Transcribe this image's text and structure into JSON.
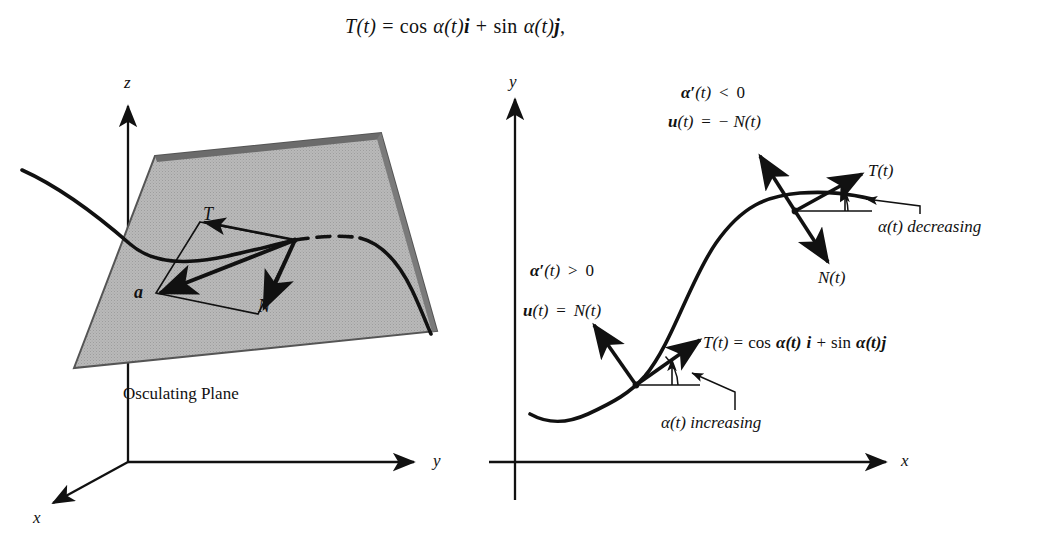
{
  "figure": {
    "type": "math-textbook-figure",
    "caption_equation": {
      "lhs": "T(t)",
      "eq": "=",
      "term1_fn": "cos",
      "term1_arg": "α(t)",
      "term1_vec": "i",
      "plus": "+",
      "term2_fn": "sin",
      "term2_arg": "α(t)",
      "term2_vec": "j",
      "comma": ","
    },
    "colors": {
      "ink": "#111111",
      "plane_fill": "#b4b4b4",
      "plane_edge": "#4a4a4a",
      "background": "#ffffff"
    }
  },
  "left_panel": {
    "title": "Osculating Plane",
    "axes": [
      {
        "name": "z",
        "label": "z",
        "direction": "up"
      },
      {
        "name": "y",
        "label": "y",
        "direction": "right"
      },
      {
        "name": "x",
        "label": "x",
        "direction": "down-left"
      }
    ],
    "vectors": [
      {
        "name": "tangent",
        "label": "T"
      },
      {
        "name": "normal",
        "label": "N"
      },
      {
        "name": "acceleration",
        "label": "a",
        "bold": true
      }
    ],
    "plane_label": "Osculating Plane",
    "curve": "space-curve-through-plane"
  },
  "right_panel": {
    "axes": [
      {
        "name": "y",
        "label": "y",
        "direction": "up"
      },
      {
        "name": "x",
        "label": "x",
        "direction": "right"
      }
    ],
    "annotations": {
      "upper_condition": {
        "alpha": "α",
        "prime": "′",
        "arg": "(t)",
        "rel": "<",
        "value": "0"
      },
      "upper_vector": {
        "u": "u",
        "arg": "(t)",
        "eq": "=",
        "sign": "−",
        "rhs": "N(t)"
      },
      "lower_condition": {
        "alpha": "α",
        "prime": "′",
        "arg": "(t)",
        "rel": ">",
        "value": "0"
      },
      "lower_vector": {
        "u": "u",
        "arg": "(t)",
        "eq": "=",
        "rhs": "N(t)"
      },
      "tangent_equation": {
        "lhs": "T(t)",
        "eq": "=",
        "term1_fn": "cos",
        "term1_arg": "α(t)",
        "term1_vec": "i",
        "plus": "+",
        "term2_fn": "sin",
        "term2_arg": "α(t)",
        "term2_vec": "j"
      },
      "angle_increasing": "α(t) increasing",
      "angle_decreasing": "α(t) decreasing"
    },
    "point_labels": {
      "upper_tangent": "T(t)",
      "upper_normal": "N(t)"
    },
    "curve": "sigmoid-shaped-plane-curve"
  }
}
